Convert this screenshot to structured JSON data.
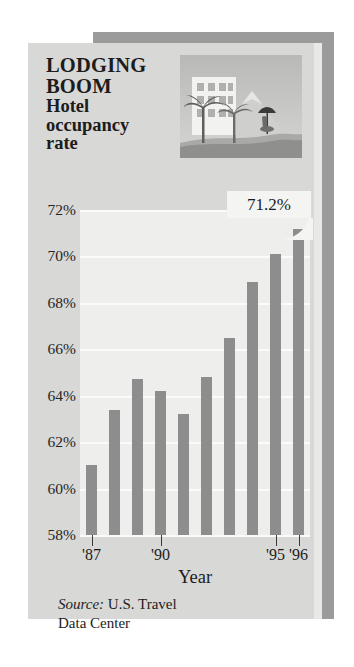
{
  "headline": {
    "line1": "LODGING",
    "line2": "BOOM",
    "line3": "Hotel",
    "line4": "occupancy",
    "line5": "rate"
  },
  "callout": {
    "value_label": "71.2%"
  },
  "illustration": {
    "name": "tropical-resort-illustration",
    "alt": "Hotel building with palm trees, mountain and beach umbrella"
  },
  "source": {
    "prefix": "Source:",
    "text": " U.S. Travel",
    "line2": "Data Center"
  },
  "colors": {
    "bar": "#8d8d8d",
    "panel": "#d8d8d6",
    "plot_bg": "#eeeeec",
    "gridline": "#fbfbfa",
    "shadow": "#9b9b9b",
    "text": "#1c1c1c",
    "callout_bg": "#f4f4f2"
  },
  "chart_data": {
    "type": "bar",
    "title": "LODGING BOOM Hotel occupancy rate",
    "subtitle": "",
    "xlabel": "Year",
    "ylabel": "",
    "categories": [
      "'87",
      "'88",
      "'89",
      "'90",
      "'91",
      "'92",
      "'93",
      "'94",
      "'95",
      "'96"
    ],
    "values": [
      61.0,
      63.4,
      64.7,
      64.2,
      63.2,
      64.8,
      66.5,
      68.9,
      70.1,
      71.2
    ],
    "value_unit": "%",
    "ylim": [
      58,
      72
    ],
    "yticks": [
      58,
      60,
      62,
      64,
      66,
      68,
      70,
      72
    ],
    "ytick_labels": [
      "58%",
      "60%",
      "62%",
      "64%",
      "66%",
      "68%",
      "70%",
      "72%"
    ],
    "xtick_indices": [
      0,
      3,
      8,
      9
    ],
    "xtick_labels": [
      "'87",
      "'90",
      "'95",
      "'96"
    ],
    "grid": true,
    "legend": false,
    "annotations": [
      {
        "label": "71.2%",
        "category": "'96",
        "value": 71.2
      }
    ],
    "source": "Source: U.S. Travel Data Center"
  }
}
